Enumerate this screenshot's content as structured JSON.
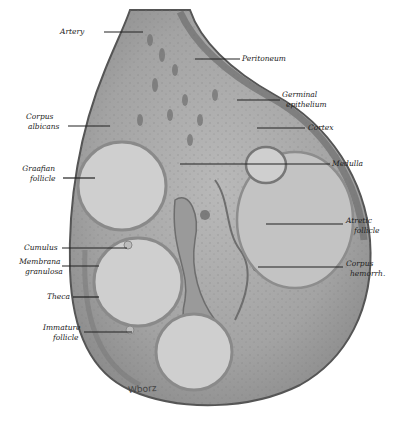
{
  "figure": {
    "signature": "Wborz",
    "labels_left": [
      {
        "id": "artery",
        "text": "Artery"
      },
      {
        "id": "corpus-albicans",
        "line1": "Corpus",
        "line2": "albicans"
      },
      {
        "id": "graafian-follicle",
        "line1": "Graafian",
        "line2": "follicle"
      },
      {
        "id": "cumulus",
        "text": "Cumulus"
      },
      {
        "id": "membrana-granulosa",
        "line1": "Membrana",
        "line2": "granulosa"
      },
      {
        "id": "theca",
        "text": "Theca"
      },
      {
        "id": "immature-follicle",
        "line1": "Immature",
        "line2": "follicle"
      }
    ],
    "labels_right": [
      {
        "id": "peritoneum",
        "text": "Peritoneum"
      },
      {
        "id": "germinal-epithelium",
        "line1": "Germinal",
        "line2": "epithelium"
      },
      {
        "id": "cortex",
        "text": "Cortex"
      },
      {
        "id": "medulla",
        "text": "Medulla"
      },
      {
        "id": "atretic-follicle",
        "line1": "Atretic",
        "line2": "follicle"
      },
      {
        "id": "corpus-hemorrh",
        "line1": "Corpus",
        "line2": "hemorrh."
      }
    ]
  }
}
